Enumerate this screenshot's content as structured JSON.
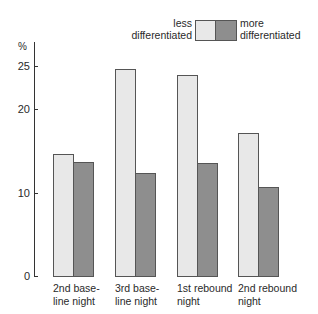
{
  "chart_data": {
    "type": "bar",
    "title": "",
    "xlabel": "",
    "ylabel": "%",
    "ylim": [
      0,
      25
    ],
    "yticks": [
      0,
      10,
      20,
      25
    ],
    "grid": false,
    "legend_position": "top-right",
    "categories": [
      "2nd base-line night",
      "3rd base-line night",
      "1st rebound night",
      "2nd rebound night"
    ],
    "category_lines": [
      [
        "2nd",
        "base-"
      ],
      [
        "3rd",
        "base-"
      ],
      [
        "1st",
        "rebound"
      ],
      [
        "2nd",
        "rebound"
      ]
    ],
    "category_labels": [
      {
        "line1": "2nd  base-",
        "line2": "line night"
      },
      {
        "line1": "3rd  base-",
        "line2": "line night"
      },
      {
        "line1": "1st  rebound",
        "line2": "night"
      },
      {
        "line1": "2nd  rebound",
        "line2": "night"
      }
    ],
    "series": [
      {
        "name": "less differentiated",
        "values": [
          14.7,
          24.9,
          24.2,
          17.2
        ],
        "color": "#e8e8e8"
      },
      {
        "name": "more differentiated",
        "values": [
          13.7,
          12.4,
          13.6,
          10.7
        ],
        "color": "#c4c4c4"
      }
    ]
  },
  "legend": {
    "less_line1": "less",
    "less_line2": "differentiated",
    "more_line1": "more",
    "more_line2": "differentiated"
  },
  "axis": {
    "unit": "%",
    "tick_25": "25",
    "tick_20": "20",
    "tick_10": "10",
    "tick_0": "0"
  }
}
